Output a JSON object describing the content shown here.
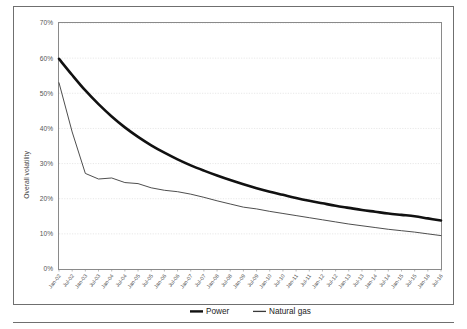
{
  "chart_data": {
    "type": "line",
    "title": "",
    "xlabel": "",
    "ylabel": "Overall volatility",
    "ylim": [
      0,
      0.7
    ],
    "ytick_labels": [
      "0%",
      "10%",
      "20%",
      "30%",
      "40%",
      "50%",
      "60%",
      "70%"
    ],
    "ytick_values": [
      0,
      10,
      20,
      30,
      40,
      50,
      60,
      70
    ],
    "grid": true,
    "legend_position": "bottom",
    "x": [
      "Jan-02",
      "Jul-02",
      "Jan-03",
      "Jul-03",
      "Jan-04",
      "Jul-04",
      "Jan-05",
      "Jul-05",
      "Jan-06",
      "Jul-06",
      "Jan-07",
      "Jul-07",
      "Jan-08",
      "Jul-08",
      "Jan-09",
      "Jul-09",
      "Jan-10",
      "Jul-10",
      "Jan-11",
      "Jul-11",
      "Jan-12",
      "Jul-12",
      "Jan-13",
      "Jul-13",
      "Jan-14",
      "Jul-14",
      "Jan-15",
      "Jul-15",
      "Jan-16",
      "Jul-16"
    ],
    "series": [
      {
        "name": "Power",
        "color": "#111111",
        "width": 2.6,
        "values": [
          59.8,
          55.2,
          50.8,
          46.9,
          43.4,
          40.3,
          37.6,
          35.2,
          33.1,
          31.2,
          29.5,
          28.0,
          26.6,
          25.3,
          24.1,
          23.0,
          22.0,
          21.1,
          20.2,
          19.4,
          18.7,
          18.0,
          17.4,
          16.8,
          16.3,
          15.8,
          15.4,
          15.0,
          14.4,
          13.8
        ]
      },
      {
        "name": "Natural gas",
        "color": "#3a3a3a",
        "width": 0.9,
        "values": [
          53.0,
          39.0,
          27.2,
          25.6,
          25.9,
          24.6,
          24.3,
          23.1,
          22.4,
          22.0,
          21.3,
          20.4,
          19.4,
          18.5,
          17.6,
          17.1,
          16.4,
          15.8,
          15.2,
          14.6,
          14.0,
          13.4,
          12.8,
          12.3,
          11.8,
          11.3,
          10.9,
          10.5,
          10.0,
          9.5
        ]
      }
    ]
  },
  "legend": {
    "items": [
      {
        "label": "Power"
      },
      {
        "label": "Natural gas"
      }
    ]
  }
}
